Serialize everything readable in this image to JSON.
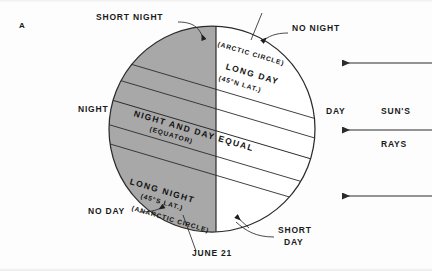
{
  "figure": {
    "panel_letter": "A",
    "date_label": "JUNE 21",
    "sun_rays_line1": "SUN'S",
    "sun_rays_line2": "RAYS"
  },
  "outer_labels": {
    "short_night": "SHORT  NIGHT",
    "no_night": "NO  NIGHT",
    "night": "NIGHT",
    "day": "DAY",
    "no_day": "NO  DAY",
    "short_day_line1": "SHORT",
    "short_day_line2": "DAY"
  },
  "zone_labels": [
    {
      "id": "arctic-circle",
      "main": "",
      "sub": "(ARCTIC CIRCLE)"
    },
    {
      "id": "long-day",
      "main": "LONG  DAY",
      "sub": "(45°N  LAT.)"
    },
    {
      "id": "equator",
      "main": "NIGHT  AND  DAY  EQUAL",
      "sub": "(EQUATOR)"
    },
    {
      "id": "long-night",
      "main": "LONG  NIGHT",
      "sub": "(45°S  LAT.)"
    },
    {
      "id": "antarctic-circle",
      "main": "",
      "sub": "(ANARCTIC CIRCLE)"
    }
  ],
  "sun_ray_arrows": [
    {
      "id": "ray-top",
      "direction": "left"
    },
    {
      "id": "ray-middle",
      "direction": "left"
    },
    {
      "id": "ray-bottom",
      "direction": "left"
    }
  ],
  "colors": {
    "background": "#ffffff",
    "night_shade": "#a8a8a8",
    "day_fill": "#ffffff",
    "outline": "#2b2b2b",
    "text": "#161616"
  },
  "geometry": {
    "circle_center_x": 212,
    "circle_center_y": 129,
    "circle_radius": 103,
    "terminator_x": 216,
    "axis_tilt_degrees": 16.5
  }
}
